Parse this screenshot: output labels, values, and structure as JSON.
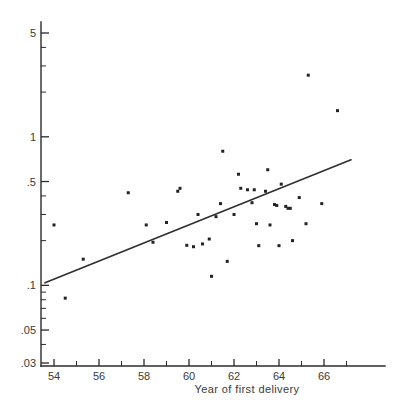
{
  "chart_data": {
    "type": "scatter",
    "title": "",
    "xlabel": "Year of first delivery",
    "ylabel": "",
    "xlim": [
      53.2,
      67.6
    ],
    "ylim": [
      0.03,
      6.0
    ],
    "yscale": "log",
    "xscale": "linear",
    "grid": false,
    "legend": null,
    "x_major_ticks": [
      54,
      56,
      58,
      60,
      62,
      64,
      66
    ],
    "x_major_tick_labels": [
      "54",
      "56",
      "58",
      "60",
      "62",
      "64",
      "66"
    ],
    "x_minor_ticks": [
      55,
      57,
      59,
      61,
      63,
      65,
      67
    ],
    "y_major_ticks": [
      5,
      1,
      0.5,
      0.1,
      0.05,
      0.03
    ],
    "y_major_tick_labels": [
      "5",
      "1",
      ".5",
      ".1",
      ".05",
      ".03"
    ],
    "y_minor_ticks": [
      4,
      3,
      2,
      0.4,
      0.3,
      0.2,
      0.09,
      0.08,
      0.07,
      0.06,
      0.04
    ],
    "points": [
      {
        "x": 54.0,
        "y": 0.255
      },
      {
        "x": 54.5,
        "y": 0.082
      },
      {
        "x": 55.3,
        "y": 0.15
      },
      {
        "x": 57.3,
        "y": 0.42
      },
      {
        "x": 58.1,
        "y": 0.255
      },
      {
        "x": 58.4,
        "y": 0.195
      },
      {
        "x": 59.0,
        "y": 0.265
      },
      {
        "x": 59.5,
        "y": 0.43
      },
      {
        "x": 59.6,
        "y": 0.45
      },
      {
        "x": 59.9,
        "y": 0.186
      },
      {
        "x": 60.2,
        "y": 0.182
      },
      {
        "x": 60.4,
        "y": 0.3
      },
      {
        "x": 60.6,
        "y": 0.19
      },
      {
        "x": 60.9,
        "y": 0.205
      },
      {
        "x": 61.0,
        "y": 0.115
      },
      {
        "x": 61.2,
        "y": 0.29
      },
      {
        "x": 61.4,
        "y": 0.355
      },
      {
        "x": 61.5,
        "y": 0.8
      },
      {
        "x": 61.7,
        "y": 0.145
      },
      {
        "x": 62.0,
        "y": 0.3
      },
      {
        "x": 62.2,
        "y": 0.56
      },
      {
        "x": 62.3,
        "y": 0.45
      },
      {
        "x": 62.6,
        "y": 0.44
      },
      {
        "x": 62.8,
        "y": 0.36
      },
      {
        "x": 62.9,
        "y": 0.44
      },
      {
        "x": 63.0,
        "y": 0.26
      },
      {
        "x": 63.1,
        "y": 0.185
      },
      {
        "x": 63.4,
        "y": 0.43
      },
      {
        "x": 63.5,
        "y": 0.6
      },
      {
        "x": 63.6,
        "y": 0.255
      },
      {
        "x": 63.8,
        "y": 0.35
      },
      {
        "x": 63.9,
        "y": 0.345
      },
      {
        "x": 64.0,
        "y": 0.185
      },
      {
        "x": 64.1,
        "y": 0.48
      },
      {
        "x": 64.3,
        "y": 0.34
      },
      {
        "x": 64.4,
        "y": 0.33
      },
      {
        "x": 64.5,
        "y": 0.33
      },
      {
        "x": 64.6,
        "y": 0.2
      },
      {
        "x": 64.9,
        "y": 0.39
      },
      {
        "x": 65.2,
        "y": 0.26
      },
      {
        "x": 65.3,
        "y": 2.6
      },
      {
        "x": 65.9,
        "y": 0.355
      },
      {
        "x": 66.6,
        "y": 1.5
      }
    ],
    "fit_line": {
      "x_start": 53.6,
      "y_start": 0.104,
      "x_end": 67.2,
      "y_end": 0.7,
      "style": "solid"
    }
  }
}
